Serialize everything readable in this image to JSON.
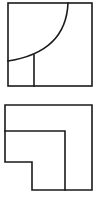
{
  "figures": [
    {
      "id": "figure-top",
      "description": "Square containing a quarter-circle arc from top edge to left edge and a small rectangle in the lower-left corner",
      "outline": {
        "x": 8,
        "y": 3,
        "width": 84,
        "height": 83
      },
      "arc": {
        "start": [
          68,
          3
        ],
        "end": [
          8,
          61
        ],
        "control": [
          66,
          50
        ]
      },
      "divider": {
        "x": 34,
        "y1": 55,
        "y2": 86
      }
    },
    {
      "id": "figure-bottom",
      "description": "L-shaped nested outline: outer square with lower-left notch and an inner L-shaped region",
      "outer_path": [
        [
          5,
          105
        ],
        [
          92,
          105
        ],
        [
          92,
          190
        ],
        [
          32,
          190
        ],
        [
          32,
          162
        ],
        [
          5,
          162
        ]
      ],
      "inner_path": [
        [
          5,
          131
        ],
        [
          65,
          131
        ],
        [
          65,
          190
        ]
      ]
    }
  ],
  "colors": {
    "stroke": "#1a1a1a",
    "background": "#ffffff"
  }
}
